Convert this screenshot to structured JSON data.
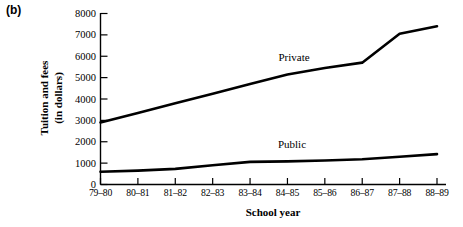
{
  "figure": {
    "panel_label": "(b)"
  },
  "chart_data": {
    "type": "line",
    "title": "",
    "xlabel": "School year",
    "ylabel": "Tuition and fees\n(in dollars)",
    "ylabel_line1": "Tuition and fees",
    "ylabel_line2": "(in dollars)",
    "categories": [
      "79–80",
      "80–81",
      "81–82",
      "82–83",
      "83–84",
      "84–85",
      "85–86",
      "86–87",
      "87–88",
      "88–89"
    ],
    "yticks": [
      0,
      1000,
      2000,
      3000,
      4000,
      5000,
      6000,
      7000,
      8000
    ],
    "ytick_labels": [
      "0",
      "1000",
      "2000",
      "3000",
      "4000",
      "5000",
      "6000",
      "7000",
      "8000"
    ],
    "ylim": [
      0,
      8000
    ],
    "grid": false,
    "legend_position": "inline-annotation",
    "series": [
      {
        "name": "Private",
        "label": "Private",
        "color": "#000000",
        "values": [
          2900,
          3350,
          3800,
          4250,
          4700,
          5150,
          5450,
          5700,
          7050,
          7400
        ]
      },
      {
        "name": "Public",
        "label": "Public",
        "color": "#000000",
        "values": [
          600,
          650,
          730,
          900,
          1060,
          1080,
          1120,
          1180,
          1300,
          1420
        ]
      }
    ],
    "annotations": [
      {
        "text": "Private",
        "series": "Private",
        "x_category": "84–85",
        "value_hint": 6000
      },
      {
        "text": "Public",
        "series": "Public",
        "x_category": "84–85",
        "value_hint": 2000
      }
    ]
  }
}
